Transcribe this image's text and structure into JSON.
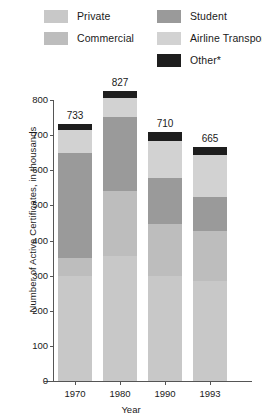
{
  "legend": {
    "items": [
      {
        "key": "private",
        "label": "Private",
        "color": "#c8c8c8",
        "swatch_name": "legend-swatch-private"
      },
      {
        "key": "commercial",
        "label": "Commercial",
        "color": "#bdbdbd",
        "swatch_name": "legend-swatch-commercial"
      },
      {
        "key": "student",
        "label": "Student",
        "color": "#9a9a9a",
        "swatch_name": "legend-swatch-student"
      },
      {
        "key": "airline",
        "label": "Airline Transport",
        "color": "#d2d2d2",
        "swatch_name": "legend-swatch-airline-transport"
      },
      {
        "key": "other",
        "label": "Other*",
        "color": "#1e1e1e",
        "swatch_name": "legend-swatch-other"
      }
    ]
  },
  "axes": {
    "y_title": "Number of Active Certificates, in thousands",
    "x_title": "Year",
    "y_ticks": [
      "0",
      "100",
      "200",
      "300",
      "400",
      "500",
      "600",
      "700",
      "800"
    ],
    "x_ticks": [
      "1970",
      "1980",
      "1990",
      "1993"
    ]
  },
  "chart_data": {
    "type": "bar",
    "stacked": true,
    "title": "",
    "xlabel": "Year",
    "ylabel": "Number of Active Certificates, in thousands",
    "categories": [
      "1970",
      "1980",
      "1990",
      "1993"
    ],
    "ylim": [
      0,
      800
    ],
    "ytick_step": 100,
    "grid": false,
    "legend_position": "top",
    "totals": [
      733,
      827,
      710,
      665
    ],
    "total_labels": [
      "733",
      "827",
      "710",
      "665"
    ],
    "series": [
      {
        "name": "Private",
        "color": "#c8c8c8",
        "values": [
          299,
          357,
          299,
          284
        ]
      },
      {
        "name": "Commercial",
        "color": "#bdbdbd",
        "values": [
          50,
          183,
          149,
          144
        ]
      },
      {
        "name": "Student",
        "color": "#9a9a9a",
        "values": [
          299,
          211,
          129,
          97
        ]
      },
      {
        "name": "Airline Transport",
        "color": "#d2d2d2",
        "values": [
          67,
          55,
          107,
          117
        ]
      },
      {
        "name": "Other*",
        "color": "#1e1e1e",
        "values": [
          18,
          21,
          26,
          23
        ]
      }
    ],
    "stack_order_bottom_to_top": [
      "Private",
      "Commercial",
      "Student",
      "Airline Transport",
      "Other*"
    ]
  }
}
